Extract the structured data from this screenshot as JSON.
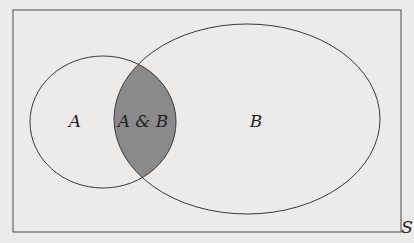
{
  "diagram": {
    "type": "venn",
    "universe_label": "S",
    "sets": [
      {
        "id": "A",
        "label": "A"
      },
      {
        "id": "B",
        "label": "B"
      }
    ],
    "intersection_label": "A & B",
    "colors": {
      "background": "#ecebea",
      "stroke": "#3a3a3a",
      "intersection_fill": "#8a8a8a"
    }
  }
}
